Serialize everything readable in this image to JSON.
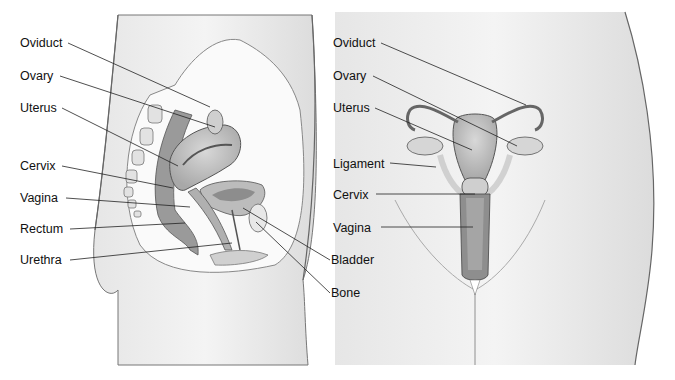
{
  "diagram": {
    "left_view": {
      "name": "Side (sagittal) view",
      "labels": [
        {
          "text": "Oviduct",
          "x": 20,
          "y": 36
        },
        {
          "text": "Ovary",
          "x": 20,
          "y": 69
        },
        {
          "text": "Uterus",
          "x": 20,
          "y": 101
        },
        {
          "text": "Cervix",
          "x": 20,
          "y": 159
        },
        {
          "text": "Vagina",
          "x": 20,
          "y": 191
        },
        {
          "text": "Rectum",
          "x": 20,
          "y": 222
        },
        {
          "text": "Urethra",
          "x": 20,
          "y": 253
        }
      ]
    },
    "shared_labels": [
      {
        "text": "Bladder",
        "x": 331,
        "y": 253
      },
      {
        "text": "Bone",
        "x": 331,
        "y": 286
      }
    ],
    "right_view": {
      "name": "Front view",
      "labels": [
        {
          "text": "Oviduct",
          "x": 333,
          "y": 36
        },
        {
          "text": "Ovary",
          "x": 333,
          "y": 69
        },
        {
          "text": "Uterus",
          "x": 333,
          "y": 101
        },
        {
          "text": "Ligament",
          "x": 333,
          "y": 157
        },
        {
          "text": "Cervix",
          "x": 333,
          "y": 188
        },
        {
          "text": "Vagina",
          "x": 333,
          "y": 221
        }
      ]
    }
  }
}
